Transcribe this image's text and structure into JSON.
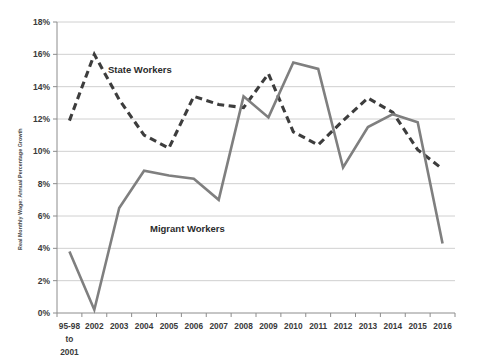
{
  "chart_data": {
    "type": "line",
    "title": "",
    "xlabel": "",
    "ylabel": "Real Monthly Wage: Annual Percentage Growth",
    "ylim": [
      0,
      18
    ],
    "ytick_labels": [
      "0%",
      "2%",
      "4%",
      "6%",
      "8%",
      "10%",
      "12%",
      "14%",
      "16%",
      "18%"
    ],
    "ytick_values": [
      0,
      2,
      4,
      6,
      8,
      10,
      12,
      14,
      16,
      18
    ],
    "grid": "horizontal",
    "legend": "inline-annotations",
    "categories": [
      "95-98\nto\n2001",
      "2002",
      "2003",
      "2004",
      "2005",
      "2006",
      "2007",
      "2008",
      "2009",
      "2010",
      "2011",
      "2012",
      "2013",
      "2014",
      "2015",
      "2016"
    ],
    "category_labels": [
      "95-98",
      "2002",
      "2003",
      "2004",
      "2005",
      "2006",
      "2007",
      "2008",
      "2009",
      "2010",
      "2011",
      "2012",
      "2013",
      "2014",
      "2015",
      "2016"
    ],
    "first_category_extra_lines": [
      "to",
      "2001"
    ],
    "series": [
      {
        "name": "State Workers",
        "style": "dashed",
        "color": "#3d3d3d",
        "values": [
          11.9,
          16.0,
          13.2,
          11.0,
          10.2,
          13.4,
          12.9,
          12.7,
          14.8,
          11.2,
          10.4,
          11.9,
          13.3,
          12.4,
          10.1,
          8.9
        ]
      },
      {
        "name": "Migrant Workers",
        "style": "solid",
        "color": "#7f7f7f",
        "values": [
          3.8,
          0.2,
          6.5,
          8.8,
          8.5,
          8.3,
          7.0,
          13.4,
          12.1,
          15.5,
          15.1,
          9.0,
          11.5,
          12.3,
          11.8,
          4.3
        ]
      }
    ],
    "annotations": [
      {
        "text": "State Workers",
        "x_px": 108,
        "y_px": 73
      },
      {
        "text": "Migrant Workers",
        "x_px": 150,
        "y_px": 232
      }
    ]
  },
  "caption": {
    "text": ""
  }
}
